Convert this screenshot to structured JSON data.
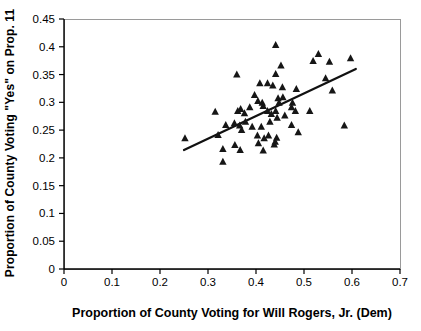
{
  "chart_data": {
    "type": "scatter",
    "title": "",
    "xlabel": "Proportion of County Voting for Will Rogers, Jr. (Dem)",
    "ylabel": "Proportion of County Voting \"Yes\" on Prop. 11",
    "xlim": [
      0,
      0.7
    ],
    "ylim": [
      0,
      0.45
    ],
    "x_ticks": [
      0,
      0.1,
      0.2,
      0.3,
      0.4,
      0.5,
      0.6,
      0.7
    ],
    "x_tick_labels": [
      "0",
      "0.1",
      "0.2",
      "0.3",
      "0.4",
      "0.5",
      "0.6",
      "0.7"
    ],
    "y_ticks": [
      0,
      0.05,
      0.1,
      0.15,
      0.2,
      0.25,
      0.3,
      0.35,
      0.4,
      0.45
    ],
    "y_tick_labels": [
      "0",
      "0.05",
      "0.1",
      "0.15",
      "0.2",
      "0.25",
      "0.3",
      "0.35",
      "0.4",
      "0.45"
    ],
    "grid": false,
    "legend": "none",
    "marker": {
      "shape": "triangle-up",
      "color": "#161616",
      "size": 7
    },
    "trendline": {
      "x_start": 0.25,
      "y_start": 0.214,
      "x_end": 0.608,
      "y_end": 0.36
    },
    "points": [
      [
        0.441,
        0.403
      ],
      [
        0.53,
        0.387
      ],
      [
        0.597,
        0.379
      ],
      [
        0.519,
        0.374
      ],
      [
        0.553,
        0.373
      ],
      [
        0.452,
        0.366
      ],
      [
        0.36,
        0.35
      ],
      [
        0.441,
        0.351
      ],
      [
        0.545,
        0.343
      ],
      [
        0.408,
        0.334
      ],
      [
        0.424,
        0.334
      ],
      [
        0.435,
        0.33
      ],
      [
        0.455,
        0.327
      ],
      [
        0.484,
        0.324
      ],
      [
        0.559,
        0.321
      ],
      [
        0.397,
        0.313
      ],
      [
        0.456,
        0.309
      ],
      [
        0.446,
        0.307
      ],
      [
        0.404,
        0.302
      ],
      [
        0.413,
        0.299
      ],
      [
        0.448,
        0.299
      ],
      [
        0.476,
        0.299
      ],
      [
        0.415,
        0.293
      ],
      [
        0.387,
        0.291
      ],
      [
        0.474,
        0.291
      ],
      [
        0.368,
        0.288
      ],
      [
        0.315,
        0.283
      ],
      [
        0.362,
        0.284
      ],
      [
        0.424,
        0.284
      ],
      [
        0.441,
        0.284
      ],
      [
        0.482,
        0.284
      ],
      [
        0.512,
        0.284
      ],
      [
        0.376,
        0.28
      ],
      [
        0.432,
        0.279
      ],
      [
        0.46,
        0.276
      ],
      [
        0.444,
        0.272
      ],
      [
        0.429,
        0.265
      ],
      [
        0.378,
        0.265
      ],
      [
        0.337,
        0.259
      ],
      [
        0.355,
        0.262
      ],
      [
        0.366,
        0.258
      ],
      [
        0.392,
        0.256
      ],
      [
        0.411,
        0.256
      ],
      [
        0.474,
        0.259
      ],
      [
        0.584,
        0.258
      ],
      [
        0.37,
        0.25
      ],
      [
        0.488,
        0.246
      ],
      [
        0.321,
        0.241
      ],
      [
        0.403,
        0.24
      ],
      [
        0.426,
        0.24
      ],
      [
        0.417,
        0.235
      ],
      [
        0.443,
        0.236
      ],
      [
        0.252,
        0.235
      ],
      [
        0.44,
        0.229
      ],
      [
        0.331,
        0.216
      ],
      [
        0.356,
        0.223
      ],
      [
        0.405,
        0.226
      ],
      [
        0.367,
        0.214
      ],
      [
        0.415,
        0.213
      ],
      [
        0.438,
        0.224
      ],
      [
        0.331,
        0.193
      ]
    ]
  },
  "colors": {
    "background": "#ffffff",
    "axis_line": "#000000",
    "plot_border": "#9a9a9a",
    "marker": "#161616",
    "trend_line": "#111111",
    "text": "#000000"
  }
}
